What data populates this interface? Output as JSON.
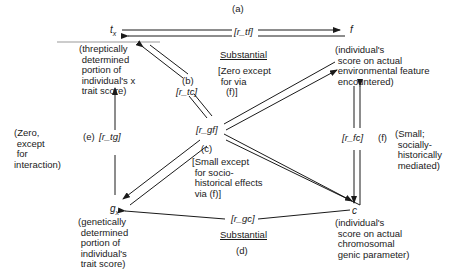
{
  "diagram": {
    "nodes": {
      "t": {
        "label": "t",
        "sub": "x",
        "desc": "(threptically\n determined\n portion of\n individual's x\n trait score)"
      },
      "f": {
        "label": "f",
        "desc": "(individual's\n score on actual\n environmental feature\n encountered)"
      },
      "g": {
        "label": "g",
        "sub": "x",
        "desc": "(genetically\n determined\n portion of\n individual's\n trait score)"
      },
      "c": {
        "label": "c",
        "desc": "(individual's\n score on actual\n chromosomal\n genic parameter)"
      }
    },
    "edges": {
      "a": {
        "letter": "(a)",
        "coef": "[r_tf]",
        "note": "Substantial"
      },
      "b": {
        "letter": "(b)",
        "coef": "[r_tc]",
        "note": "[Zero except\n for via\n   (f)]"
      },
      "c": {
        "letter": "(c)",
        "coef": "[r_gf]",
        "note": "[Small except\n for socio-\n historical effects\n via (f)]"
      },
      "d": {
        "letter": "(d)",
        "coef": "[r_gc]",
        "note": "Substantial"
      },
      "e": {
        "letter": "(e)",
        "coef": "[r_tg]",
        "note": "(Zero,\n except\n for\ninteraction)"
      },
      "f": {
        "letter": "(f)",
        "coef": "[r_fc]",
        "note": "(Small;\n socially-\n historically\n mediated)"
      }
    }
  }
}
